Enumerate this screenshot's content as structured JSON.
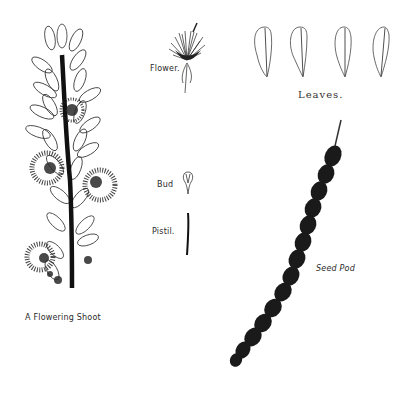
{
  "plate": {
    "background": "#ffffff",
    "ink_color": "#1a1a1a"
  },
  "labels": {
    "flowering_shoot": "A Flowering Shoot",
    "flower": "Flower.",
    "leaves": "Leaves.",
    "bud": "Bud",
    "pistil": "Pistil.",
    "seed_pod": "Seed Pod"
  },
  "specimens": [
    {
      "name": "flowering-shoot",
      "count_leaf_clusters": 10
    },
    {
      "name": "flower"
    },
    {
      "name": "leaves",
      "count": 4
    },
    {
      "name": "bud"
    },
    {
      "name": "pistil"
    },
    {
      "name": "seed-pod",
      "segments": 18
    }
  ]
}
